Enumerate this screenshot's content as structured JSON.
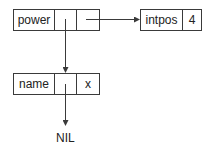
{
  "diagram": {
    "type": "linked-record-structure",
    "nodes": [
      {
        "id": "power",
        "cells": [
          "power",
          "",
          ""
        ]
      },
      {
        "id": "intpos",
        "cells": [
          "intpos",
          "4"
        ]
      },
      {
        "id": "name",
        "cells": [
          "name",
          "",
          "x"
        ]
      }
    ],
    "edges": [
      {
        "from": "power.cell2",
        "to": "intpos",
        "direction": "right"
      },
      {
        "from": "power.cell1",
        "to": "name",
        "direction": "down"
      },
      {
        "from": "name.cell1",
        "to": "nil",
        "direction": "down"
      }
    ],
    "terminal": {
      "label": "NIL"
    },
    "colors": {
      "stroke": "#3a3a3a",
      "text": "#222222",
      "background": "#ffffff"
    }
  }
}
